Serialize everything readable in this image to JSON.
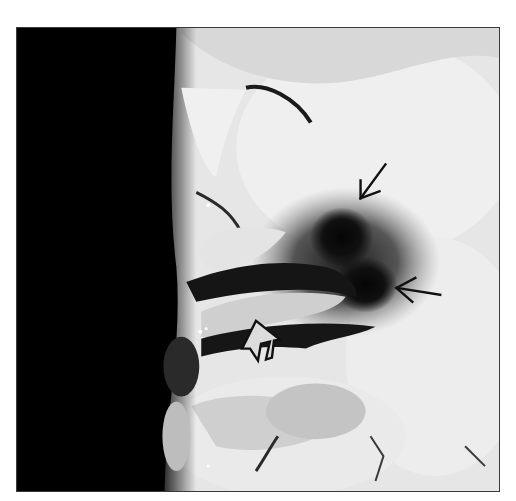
{
  "figure": {
    "colors": {
      "background": "#ffffff",
      "void": "#000000",
      "tissue_light": "#ececec",
      "tissue_mid": "#c9c9c9",
      "lesion": "#0a0a0a",
      "border": "#3a3a3a",
      "arrow": "#111111"
    },
    "annotations": [
      {
        "type": "thin-arrow",
        "direction": "down-left",
        "label": "upper lesion arrow"
      },
      {
        "type": "thin-arrow",
        "direction": "left",
        "label": "lower lesion arrow"
      },
      {
        "type": "open-arrow",
        "direction": "up-left",
        "label": "open arrow marking sulcal lesion"
      }
    ]
  }
}
